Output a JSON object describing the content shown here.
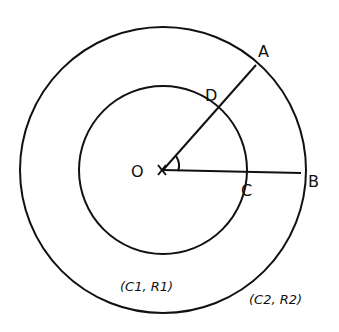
{
  "diagram": {
    "type": "concentric-circles",
    "center": {
      "label": "O",
      "marker": "x"
    },
    "inner_circle": {
      "label": "(C1, R1)"
    },
    "outer_circle": {
      "label": "(C2, R2)"
    },
    "points": {
      "A": "A",
      "B": "B",
      "C": "C",
      "D": "D"
    },
    "segments": [
      "O-A",
      "O-B"
    ],
    "angle_marker": "angle AOB",
    "stroke_color": "#111111",
    "background": "#ffffff"
  }
}
